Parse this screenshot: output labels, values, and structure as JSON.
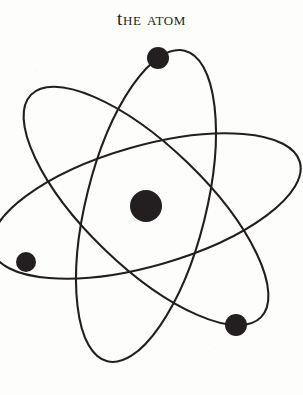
{
  "figure": {
    "title": "The Atom",
    "background_color": "#fdfdfb",
    "ink_color": "#231f20"
  },
  "diagram": {
    "name": "bohr-model-atom",
    "canvas": {
      "width": 303,
      "height": 395
    },
    "nucleus": {
      "label": "nucleus",
      "cx": 146,
      "cy": 206,
      "r": 16,
      "color": "#231f20"
    },
    "electrons": [
      {
        "label": "electron-top",
        "cx": 158,
        "cy": 58,
        "r": 11,
        "color": "#231f20"
      },
      {
        "label": "electron-left",
        "cx": 26,
        "cy": 262,
        "r": 10,
        "color": "#231f20"
      },
      {
        "label": "electron-lower-right",
        "cx": 236,
        "cy": 325,
        "r": 11,
        "color": "#231f20"
      }
    ],
    "orbits": [
      {
        "label": "orbit-1",
        "cx": 146,
        "cy": 206,
        "rx": 60,
        "ry": 160,
        "rotation_deg": 14,
        "stroke_width": 2.1
      },
      {
        "label": "orbit-2",
        "cx": 146,
        "cy": 206,
        "rx": 60,
        "ry": 160,
        "rotation_deg": 74,
        "stroke_width": 2.1
      },
      {
        "label": "orbit-3",
        "cx": 146,
        "cy": 206,
        "rx": 60,
        "ry": 160,
        "rotation_deg": 134,
        "stroke_width": 2.1
      }
    ]
  }
}
